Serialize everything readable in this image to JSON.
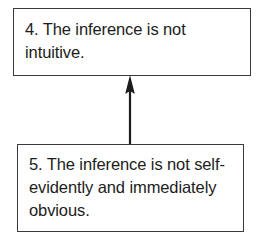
{
  "diagram": {
    "type": "flowchart",
    "orientation": "bottom-to-top",
    "background_color": "#ffffff",
    "border_color": "#3a3a3a",
    "text_color": "#1c1c1c",
    "nodes": [
      {
        "id": "4",
        "number": "4.",
        "text": "4. The inference is not intuitive.",
        "lines": [
          "4. The inference is not",
          "intuitive."
        ]
      },
      {
        "id": "5",
        "number": "5.",
        "text": "5. The inference is not self-evidently and immediately obvious.",
        "lines": [
          "5. The inference is not",
          "self-evidently and",
          "immediately obvious."
        ]
      }
    ],
    "connectors": [
      {
        "from": "5",
        "to": "4",
        "style": "solid-line-with-arrowhead",
        "direction": "up"
      }
    ]
  }
}
